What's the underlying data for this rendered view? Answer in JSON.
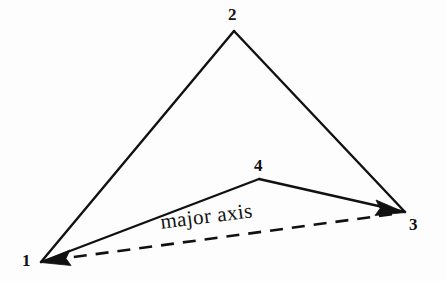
{
  "figure": {
    "background_color": "#fdfdfd",
    "stroke_color": "#111111",
    "canvas": {
      "width": 446,
      "height": 281
    },
    "annotation": {
      "major_axis_label": "major axis"
    },
    "vertices": [
      {
        "id": "1",
        "label": "1",
        "x": 41,
        "y": 262
      },
      {
        "id": "2",
        "label": "2",
        "x": 234,
        "y": 31
      },
      {
        "id": "3",
        "label": "3",
        "x": 405,
        "y": 212
      },
      {
        "id": "4",
        "label": "4",
        "x": 259,
        "y": 179
      }
    ],
    "solid_edges": [
      {
        "name": "edge-1-2",
        "from": "1",
        "to": "2"
      },
      {
        "name": "edge-2-3",
        "from": "2",
        "to": "3"
      },
      {
        "name": "edge-1-4",
        "from": "1",
        "to": "4"
      },
      {
        "name": "edge-4-3",
        "from": "4",
        "to": "3"
      }
    ],
    "dashed_axis": {
      "name": "major-axis-line",
      "from": "1",
      "to": "3",
      "style": "dashed",
      "arrowheads": "both",
      "dash_length": 13,
      "gap_length": 9
    }
  }
}
